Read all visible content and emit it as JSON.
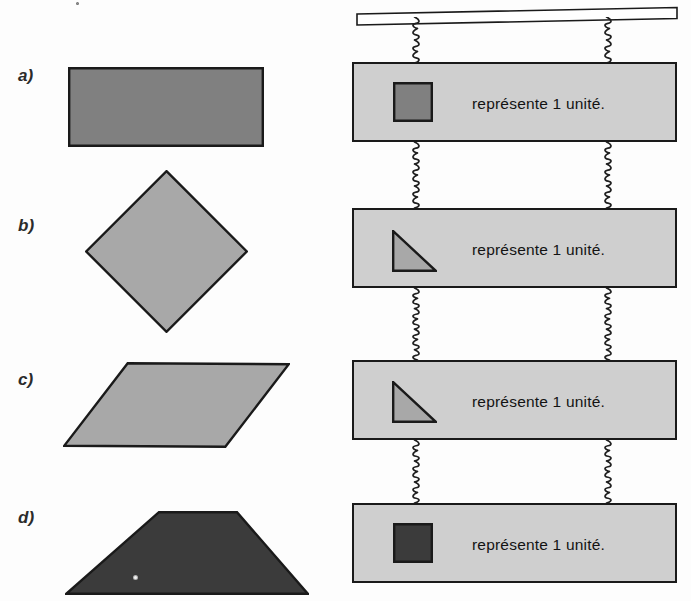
{
  "document": {
    "title": "Exercice de figures géométriques — mobile",
    "language": "fr",
    "background_color": "#fdfdfd"
  },
  "colors": {
    "outline": "#1a1a1a",
    "panel_fill": "#cfcfcf",
    "dark_gray_fill": "#808080",
    "light_gray_fill": "#a8a8a8",
    "very_dark_fill": "#3b3b3b",
    "text": "#131313",
    "label_text": "#2b2b2b",
    "bar_fill": "#ffffff"
  },
  "rows": [
    {
      "label": "a)",
      "label_x": 18,
      "label_y": 66,
      "figure": {
        "name": "rectangle",
        "shape": "rectangle",
        "fill": "#808080",
        "x": 68,
        "y": 67,
        "width": 196,
        "height": 80
      },
      "panel": {
        "x": 352,
        "y": 62,
        "width": 325,
        "height": 80,
        "text": "représente 1 unité.",
        "text_x": 470,
        "text_y": 93,
        "unit_shape": {
          "name": "square",
          "shape": "square",
          "fill": "#808080",
          "x": 391,
          "y": 80,
          "width": 40,
          "height": 40
        }
      }
    },
    {
      "label": "b)",
      "label_x": 18,
      "label_y": 216,
      "figure": {
        "name": "diamond",
        "shape": "diamond",
        "fill": "#a8a8a8",
        "x": 85,
        "y": 170,
        "width": 163,
        "height": 163
      },
      "panel": {
        "x": 352,
        "y": 208,
        "width": 325,
        "height": 80,
        "text": "représente 1 unité.",
        "text_x": 470,
        "text_y": 239,
        "unit_shape": {
          "name": "right-triangle",
          "shape": "right-triangle",
          "fill": "#a8a8a8",
          "x": 390,
          "y": 228,
          "width": 45,
          "height": 42
        }
      }
    },
    {
      "label": "c)",
      "label_x": 18,
      "label_y": 370,
      "figure": {
        "name": "parallelogram",
        "shape": "parallelogram",
        "fill": "#a8a8a8",
        "x": 63,
        "y": 362,
        "width": 227,
        "height": 86
      },
      "panel": {
        "x": 352,
        "y": 360,
        "width": 325,
        "height": 80,
        "text": "représente 1 unité.",
        "text_x": 470,
        "text_y": 391,
        "unit_shape": {
          "name": "right-triangle",
          "shape": "right-triangle",
          "fill": "#a8a8a8",
          "x": 390,
          "y": 379,
          "width": 45,
          "height": 42
        }
      }
    },
    {
      "label": "d)",
      "label_x": 18,
      "label_y": 508,
      "figure": {
        "name": "trapezoid",
        "shape": "trapezoid",
        "fill": "#3b3b3b",
        "x": 65,
        "y": 511,
        "width": 244,
        "height": 84
      },
      "panel": {
        "x": 352,
        "y": 503,
        "width": 325,
        "height": 80,
        "text": "représente 1 unité.",
        "text_x": 470,
        "text_y": 534,
        "unit_shape": {
          "name": "square",
          "shape": "square",
          "fill": "#3b3b3b",
          "x": 391,
          "y": 521,
          "width": 40,
          "height": 40
        }
      }
    }
  ],
  "top_bar": {
    "name": "horizontal-support-bar",
    "x": 356,
    "y": 6,
    "width": 322,
    "height": 12,
    "fill": "#ffffff"
  },
  "chains": [
    {
      "name": "chain-left-0",
      "x": 416,
      "y": 17,
      "height": 46
    },
    {
      "name": "chain-right-0",
      "x": 608,
      "y": 17,
      "height": 46
    },
    {
      "name": "chain-left-1",
      "x": 416,
      "y": 142,
      "height": 66
    },
    {
      "name": "chain-right-1",
      "x": 608,
      "y": 142,
      "height": 66
    },
    {
      "name": "chain-left-2",
      "x": 416,
      "y": 288,
      "height": 72
    },
    {
      "name": "chain-right-2",
      "x": 608,
      "y": 288,
      "height": 72
    },
    {
      "name": "chain-left-3",
      "x": 416,
      "y": 440,
      "height": 63
    },
    {
      "name": "chain-right-3",
      "x": 608,
      "y": 440,
      "height": 63
    }
  ],
  "artifacts": [
    {
      "name": "scan-speck-trapezoid",
      "x": 133,
      "y": 575,
      "size": 5,
      "color": "#f2f2f2"
    },
    {
      "name": "scan-speck-top",
      "x": 76,
      "y": 2,
      "size": 3,
      "color": "#9a9a9a"
    }
  ]
}
